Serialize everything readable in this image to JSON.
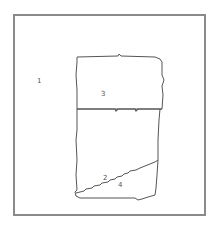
{
  "diagram": {
    "type": "region-partition",
    "colors": {
      "line": "#555555",
      "frame": "#8a8a8a",
      "background": "#ffffff"
    },
    "regions": [
      {
        "id": "region-1",
        "label": "1"
      },
      {
        "id": "region-2",
        "label": "2"
      },
      {
        "id": "region-3",
        "label": "3"
      },
      {
        "id": "region-4",
        "label": "4"
      }
    ]
  }
}
